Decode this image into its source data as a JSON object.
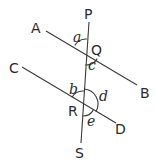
{
  "figure": {
    "stroke_color": "#3a3a3a",
    "text_color": "#2a2a2a",
    "points": {
      "P": "P",
      "Q": "Q",
      "R": "R",
      "S": "S",
      "A": "A",
      "B": "B",
      "C": "C",
      "D": "D"
    },
    "angles": {
      "a": "a",
      "b": "b",
      "c": "c",
      "d": "d",
      "e": "e"
    },
    "lines": [
      {
        "name": "AB",
        "from": "A",
        "to": "B"
      },
      {
        "name": "CD",
        "from": "C",
        "to": "D"
      },
      {
        "name": "PS",
        "from": "P",
        "to": "S"
      }
    ]
  }
}
